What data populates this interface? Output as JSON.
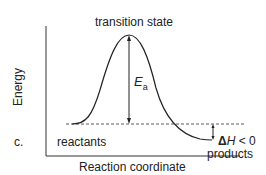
{
  "panel_label": "c.",
  "y_axis_label": "Energy",
  "x_axis_label": "Reaction coordinate",
  "labels": {
    "transition_state": "transition state",
    "reactants": "reactants",
    "products": "products",
    "activation_energy_main": "E",
    "activation_energy_sub": "a",
    "delta_h_prefix": "Δ",
    "delta_h_var": "H",
    "delta_h_suffix": " < 0"
  }
}
